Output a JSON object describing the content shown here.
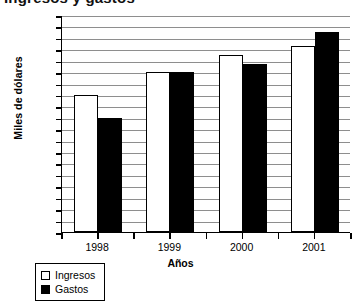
{
  "title_fragment": "Ingresos y gastos",
  "chart_data": {
    "type": "bar",
    "title": "Ingresos y gastos",
    "xlabel": "Años",
    "ylabel": "Miles de dólares",
    "categories": [
      "1998",
      "1999",
      "2000",
      "2001"
    ],
    "series": [
      {
        "name": "Ingresos",
        "color": "#ffffff",
        "values": [
          24,
          28,
          31,
          32.5
        ]
      },
      {
        "name": "Gastos",
        "color": "#000000",
        "values": [
          20,
          28,
          29.5,
          35
        ]
      }
    ],
    "ylim": [
      0,
      38
    ],
    "ytick_step": 2,
    "yticks": [
      0,
      2,
      4,
      6,
      8,
      10,
      12,
      14,
      16,
      18,
      20,
      22,
      24,
      26,
      28,
      30,
      32,
      34,
      36,
      38
    ],
    "ytick_labels": [
      "0",
      "2",
      "4",
      "6",
      "8",
      "10",
      "12",
      "14",
      "16",
      "18",
      "20",
      "22",
      "24",
      "26",
      "28",
      "30",
      "32",
      "34",
      "36",
      "38"
    ],
    "grid": true,
    "grid_axis": "y",
    "legend_position": "below-left",
    "legend": [
      "Ingresos",
      "Gastos"
    ]
  },
  "axes": {
    "y_title": "Miles de dólares",
    "x_title": "Años"
  },
  "legend": {
    "items": [
      {
        "label": "Ingresos",
        "swatch": "white"
      },
      {
        "label": "Gastos",
        "swatch": "black"
      }
    ]
  }
}
